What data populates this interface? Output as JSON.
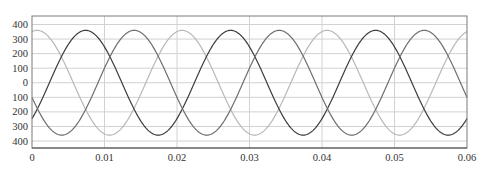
{
  "chart_data": {
    "type": "line",
    "title": "",
    "xlabel": "",
    "ylabel": "",
    "xlim": [
      0,
      0.06
    ],
    "ylim": [
      -400,
      400
    ],
    "grid": true,
    "legend": null,
    "x_ticks": [
      0,
      0.01,
      0.02,
      0.03,
      0.04,
      0.05,
      0.06
    ],
    "x_tick_labels": [
      "0",
      "0.01",
      "0.02",
      "0.03",
      "0.04",
      "0.05",
      "0.06"
    ],
    "y_ticks": [
      400,
      300,
      200,
      100,
      0,
      -100,
      -200,
      -300,
      -400
    ],
    "y_tick_labels": [
      "400",
      "300",
      "200",
      "100",
      "0",
      "100",
      "200",
      "300",
      "400"
    ],
    "x": [
      0,
      0.002,
      0.004,
      0.006,
      0.008,
      0.01,
      0.012,
      0.014,
      0.016,
      0.018,
      0.02,
      0.022,
      0.024,
      0.026,
      0.028,
      0.03,
      0.032,
      0.034,
      0.036,
      0.038,
      0.04,
      0.042,
      0.044,
      0.046,
      0.048,
      0.05,
      0.052,
      0.054,
      0.056,
      0.058,
      0.06
    ],
    "series": [
      {
        "name": "phase-light",
        "color": "#b8b8b8",
        "amplitude": 360,
        "frequency_hz": 50,
        "peak_time": 0.0007,
        "values": [
          351,
          330,
          183,
          -34,
          -238,
          -351,
          -330,
          -183,
          34,
          238,
          351,
          330,
          183,
          -34,
          -238,
          -351,
          -330,
          -183,
          34,
          238,
          351,
          330,
          183,
          -34,
          -238,
          -351,
          -330,
          -183,
          34,
          238,
          351
        ]
      },
      {
        "name": "phase-dark",
        "color": "#3c3c3c",
        "amplitude": 360,
        "frequency_hz": 50,
        "peak_time": 0.0074,
        "values": [
          -247,
          -45,
          173,
          326,
          354,
          247,
          45,
          -173,
          -326,
          -354,
          -247,
          -45,
          173,
          326,
          354,
          247,
          45,
          -173,
          -326,
          -354,
          -247,
          -45,
          173,
          326,
          354,
          247,
          45,
          -173,
          -326,
          -354,
          -247
        ]
      },
      {
        "name": "phase-medium",
        "color": "#6e6e6e",
        "amplitude": 360,
        "frequency_hz": 50,
        "peak_time": 0.0141,
        "values": [
          -100,
          -284,
          -360,
          -298,
          -122,
          100,
          284,
          360,
          298,
          122,
          -100,
          -284,
          -360,
          -298,
          -122,
          100,
          284,
          360,
          298,
          122,
          -100,
          -284,
          -360,
          -298,
          -122,
          100,
          284,
          360,
          298,
          122,
          -100
        ]
      }
    ]
  },
  "style": {
    "grid_color": "#d2d2d2",
    "frame_color": "#7a7a7a",
    "axis_color": "#555555"
  }
}
